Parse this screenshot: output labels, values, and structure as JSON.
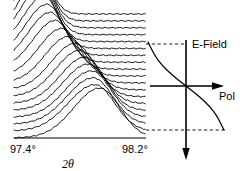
{
  "chart_data": {
    "type": "line",
    "title": "",
    "panels": [
      {
        "name": "xrd-waterfall",
        "type": "line",
        "description": "Waterfall stack of X-ray diffraction scans versus 2-theta",
        "xlabel": "2θ",
        "xtick_labels": [
          "97.4°",
          "98.2°"
        ],
        "xlim": [
          97.4,
          98.2
        ],
        "ylabel": "",
        "grid": false,
        "legend": false,
        "n_traces": 19,
        "trace_peak_positions": [
          97.52,
          97.53,
          97.54,
          97.55,
          97.56,
          97.58,
          97.6,
          97.62,
          97.65,
          97.69,
          97.73,
          97.77,
          97.8,
          97.83,
          97.85,
          97.87,
          97.88,
          97.89,
          97.92
        ],
        "trace_peak_amplitudes": [
          1.0,
          0.98,
          0.96,
          0.94,
          0.92,
          0.9,
          0.88,
          0.86,
          0.84,
          0.82,
          0.8,
          0.8,
          0.8,
          0.8,
          0.8,
          0.8,
          0.8,
          0.8,
          0.86
        ]
      },
      {
        "name": "efield-pol-curve",
        "type": "line",
        "description": "Sigmoidal saturation curve of polarization versus applied electric field",
        "xlabel": "Pol",
        "ylabel": "E-Field",
        "grid": false,
        "legend": false,
        "x_axis_direction": "right",
        "y_axis_direction": "down",
        "origin_label": "",
        "curve_points": [
          {
            "pol": -1.0,
            "efield": 1.0
          },
          {
            "pol": -0.92,
            "efield": 0.86
          },
          {
            "pol": -0.8,
            "efield": 0.66
          },
          {
            "pol": -0.62,
            "efield": 0.46
          },
          {
            "pol": -0.4,
            "efield": 0.28
          },
          {
            "pol": -0.18,
            "efield": 0.12
          },
          {
            "pol": 0.0,
            "efield": 0.0
          },
          {
            "pol": 0.18,
            "efield": -0.12
          },
          {
            "pol": 0.4,
            "efield": -0.28
          },
          {
            "pol": 0.62,
            "efield": -0.46
          },
          {
            "pol": 0.8,
            "efield": -0.66
          },
          {
            "pol": 0.92,
            "efield": -0.86
          },
          {
            "pol": 1.0,
            "efield": -1.0
          }
        ]
      }
    ],
    "annotations": [
      {
        "name": "top-guide",
        "style": "dashed",
        "description": "dashed guide joining top of waterfall to top of E-Field axis"
      },
      {
        "name": "bottom-guide",
        "style": "dashed",
        "description": "dashed guide joining baseline of waterfall to bottom of curve"
      }
    ]
  },
  "labels": {
    "x_tick_left": "97.4°",
    "x_tick_right": "98.2°",
    "x_axis_name": "2θ",
    "efield_label": "E-Field",
    "pol_label": "Pol"
  },
  "colors": {
    "background": "#ffffff",
    "ink": "#000000",
    "guide": "#000000"
  }
}
